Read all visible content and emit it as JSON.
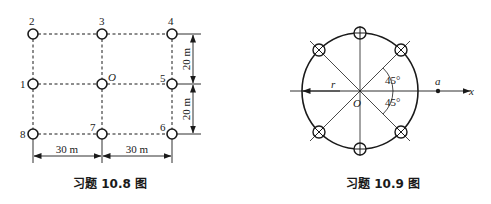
{
  "figure_left": {
    "caption": "习题 10.8 图",
    "wells": [
      {
        "id": "2",
        "label": "2"
      },
      {
        "id": "3",
        "label": "3"
      },
      {
        "id": "4",
        "label": "4"
      },
      {
        "id": "1",
        "label": "1"
      },
      {
        "id": "O",
        "label": "O"
      },
      {
        "id": "5",
        "label": "5"
      },
      {
        "id": "8",
        "label": "8"
      },
      {
        "id": "7",
        "label": "7"
      },
      {
        "id": "6",
        "label": "6"
      }
    ],
    "dimensions": {
      "vertical_upper": "20 m",
      "vertical_lower": "20 m",
      "horizontal_left": "30 m",
      "horizontal_right": "30 m"
    }
  },
  "figure_right": {
    "caption": "习题 10.9 图",
    "center_label": "O",
    "radius_label": "r",
    "point_label": "a",
    "axis_label": "x",
    "angle_upper": "45°",
    "angle_lower": "45°",
    "well_count": 6
  }
}
